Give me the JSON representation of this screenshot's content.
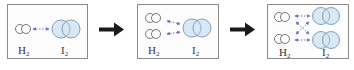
{
  "diagram": {
    "title": "",
    "colors": {
      "panel_border": "#8a8a8a",
      "h2_fill": "#ffffff",
      "h2_stroke": "#555555",
      "i2_fill": "#d8e8f5",
      "i2_stroke": "#6a8aa8",
      "interaction_arrow": "#6a70c8",
      "flow_arrow": "#1a1a1a"
    },
    "panels": [
      {
        "id": "step-1",
        "h2_label": "H",
        "h2_sub": "2",
        "i2_label": "I",
        "i2_sub": "2",
        "h2_molecules": 1,
        "i2_molecules": 1,
        "interactions": [
          "H2-1 ↔ I2-1"
        ]
      },
      {
        "id": "step-2",
        "h2_label": "H",
        "h2_sub": "2",
        "i2_label": "I",
        "i2_sub": "2",
        "h2_molecules": 2,
        "i2_molecules": 1,
        "interactions": [
          "H2-1 ↔ I2-1",
          "H2-2 ↔ I2-1"
        ]
      },
      {
        "id": "step-3",
        "h2_label": "H",
        "h2_sub": "2",
        "i2_label": "I",
        "i2_sub": "2",
        "h2_molecules": 2,
        "i2_molecules": 2,
        "interactions": [
          "H2-1 ↔ I2-1",
          "H2-1 ↔ I2-2",
          "H2-2 ↔ I2-1",
          "H2-2 ↔ I2-2"
        ]
      }
    ],
    "flow_arrows": [
      "step-1 → step-2",
      "step-2 → step-3"
    ]
  }
}
